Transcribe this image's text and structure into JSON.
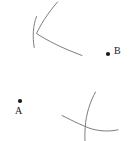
{
  "figure": {
    "type": "geometric-construction",
    "canvas": {
      "width": 134,
      "height": 141,
      "background": "#ffffff"
    },
    "stroke_color": "#6e6e70",
    "point_color": "#1a1a1a",
    "points": [
      {
        "id": "A",
        "label": "A",
        "x": 20,
        "y": 101,
        "radius": 2.1,
        "label_x": 15,
        "label_y": 106
      },
      {
        "id": "B",
        "label": "B",
        "x": 108,
        "y": 54,
        "radius": 2.1,
        "label_x": 114,
        "label_y": 46
      }
    ],
    "arcs": [
      {
        "id": "arc-upper-vertical",
        "name": "upper-left-near-vertical-arc",
        "path": "M 36.5 16.5 C 33.0 25.0 32.4 37.0 34.2 47.5"
      },
      {
        "id": "arc-upper-sweeping",
        "name": "upper-left-sweeping-arc",
        "path": "M 57.5 2.0 C 47.0 14.0 40.0 26.0 36.5 33.5 C 48.0 41.0 62.0 48.0 82.0 55.5"
      },
      {
        "id": "arc-lower-vertical",
        "name": "lower-right-near-vertical-arc",
        "path": "M 95.5 92.0 C 90.0 102.0 86.0 114.0 85.2 127.5 C 84.8 133.0 84.8 137.5 85.0 141.0"
      },
      {
        "id": "arc-lower-sweeping",
        "name": "lower-right-sweeping-arc",
        "path": "M 62.0 115.5 C 74.0 121.5 84.0 126.5 92.0 129.0 C 101.0 131.5 110.0 131.5 118.0 129.8"
      }
    ]
  }
}
